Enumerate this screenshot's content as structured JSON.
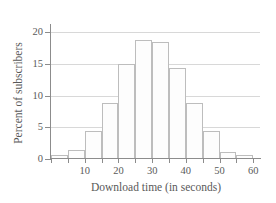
{
  "chart_data": {
    "type": "bar",
    "title": "",
    "subtitle": "",
    "xlabel": "Download time (in seconds)",
    "ylabel": "Percent of subscribers",
    "xlim": [
      0,
      62
    ],
    "ylim": [
      0,
      21
    ],
    "grid": true,
    "legend": false,
    "legend_position": "none",
    "bin_width": 5,
    "bin_edges": [
      0,
      5,
      10,
      15,
      20,
      25,
      30,
      35,
      40,
      45,
      50,
      55,
      60
    ],
    "categories": [
      "0-5",
      "5-10",
      "10-15",
      "15-20",
      "20-25",
      "25-30",
      "30-35",
      "35-40",
      "40-45",
      "45-50",
      "50-55",
      "55-60"
    ],
    "values": [
      0.6,
      1.5,
      4.5,
      8.8,
      15.0,
      18.8,
      18.5,
      14.4,
      8.8,
      4.5,
      1.1,
      0.7
    ],
    "x_ticks": [
      0,
      5,
      10,
      15,
      20,
      25,
      30,
      35,
      40,
      45,
      50,
      55,
      60
    ],
    "x_tick_labels": [
      "10",
      "20",
      "30",
      "40",
      "50",
      "60"
    ],
    "x_tick_label_values": [
      10,
      20,
      30,
      40,
      50,
      60
    ],
    "y_ticks": [
      0,
      5,
      10,
      15,
      20
    ],
    "y_tick_labels": [
      "0",
      "5",
      "10",
      "15",
      "20"
    ],
    "colors": {
      "bar_fill": "#fdfdfd",
      "bar_edge": "#bdbdbd",
      "gridline": "#d8d8d8",
      "axis": "#8c8c8c",
      "text": "#5a5a5a",
      "background": "#ffffff"
    }
  }
}
